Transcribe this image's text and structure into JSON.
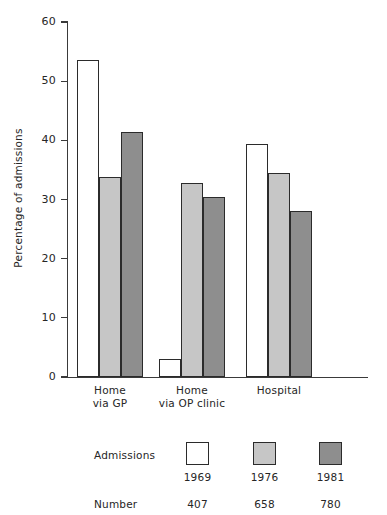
{
  "chart_data": {
    "type": "bar",
    "title": "",
    "subtitle": "",
    "xlabel": "",
    "ylabel": "Percentage of admissions",
    "ylim": [
      0,
      60
    ],
    "yticks": [
      0,
      10,
      20,
      30,
      40,
      50,
      60
    ],
    "ytick_labels": [
      "0",
      "10",
      "20",
      "30",
      "40",
      "50",
      "60"
    ],
    "grid": false,
    "legend_position": "bottom",
    "categories": [
      "Home\nvia GP",
      "Home\nvia OP clinic",
      "Hospital"
    ],
    "category_lines": [
      [
        "Home",
        "via GP"
      ],
      [
        "Home",
        "via OP clinic"
      ],
      [
        "Hospital",
        ""
      ]
    ],
    "series": [
      {
        "name": "1969",
        "color": "#ffffff",
        "values": [
          53.5,
          3.0,
          39.4
        ]
      },
      {
        "name": "1976",
        "color": "#c6c6c6",
        "values": [
          33.8,
          32.8,
          34.5
        ]
      },
      {
        "name": "1981",
        "color": "#8e8e8e",
        "values": [
          41.4,
          30.4,
          28.0
        ]
      }
    ],
    "legend": {
      "row1_label": "Admissions",
      "row2_label": "Number",
      "entries": [
        {
          "year": "1969",
          "number": "407",
          "color": "#ffffff"
        },
        {
          "year": "1976",
          "number": "658",
          "color": "#c6c6c6"
        },
        {
          "year": "1981",
          "number": "780",
          "color": "#8e8e8e"
        }
      ]
    },
    "colors": {
      "axis": "#3a3a3a",
      "bar_edge": "#2b2b2b",
      "text": "#262626",
      "background": "#ffffff"
    }
  }
}
